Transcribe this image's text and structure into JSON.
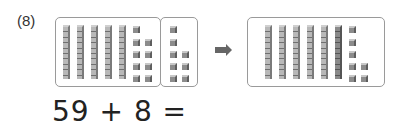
{
  "problem": {
    "number_label": "(8)",
    "equation": "59 + 8 =",
    "left_group": {
      "tens": 5,
      "ones": 9
    },
    "added_group": {
      "tens": 0,
      "ones": 8
    },
    "result_group": {
      "tens": 6,
      "ones": 7
    },
    "arrow_icon": "right-arrow-icon"
  }
}
